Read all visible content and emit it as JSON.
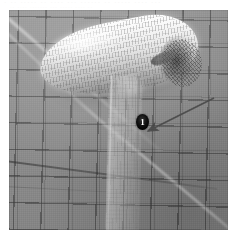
{
  "figure": {
    "kind": "photograph",
    "scene_description": "Grayscale rendering of a scanned hair dryer reconstructed as a dense triangle/quad wireframe mesh, shown in front of a square calibration grid backdrop with stray light streaks.",
    "background_color": "#8e8e8e",
    "grid_line_color": "#3a3a3a",
    "mesh_highlight_color": "#fafafa",
    "mesh_shadow_color": "#8c8c8c"
  },
  "scan_residue": {
    "line1": "· ··  ····· ·· ····  ··· ······ ·· ·····  ···· ···",
    "line2": "·· ···· ······· ··· ····· ···· ··"
  },
  "annotations": {
    "marker": {
      "label": "1",
      "shape": "filled-circle",
      "fill_color": "#0d0d0d",
      "text_color": "#ffffff",
      "x": 133,
      "y": 112
    },
    "arrow": {
      "color": "#4a4a4a",
      "from_x": 214,
      "from_y": 98,
      "to_x": 147,
      "to_y": 130,
      "style": "solid-line-with-filled-head",
      "points_to": "marker-1"
    }
  },
  "object_parts": {
    "barrel": "hair-dryer-barrel",
    "nozzle": "hair-dryer-nozzle",
    "handle": "hair-dryer-handle",
    "defect": "mesh-artifact-region"
  }
}
